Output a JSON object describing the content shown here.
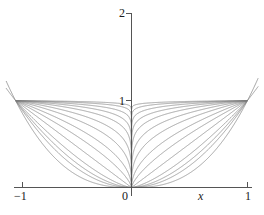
{
  "chart_data": {
    "type": "line",
    "title": "",
    "xlabel": "x",
    "ylabel": "",
    "xlim": [
      -1.12,
      1.12
    ],
    "ylim": [
      0,
      2.12
    ],
    "grid": false,
    "legend": null,
    "x_ticks": [
      {
        "value": -1,
        "label": "−1"
      },
      {
        "value": 0,
        "label": "0"
      },
      {
        "value": 1,
        "label": "1"
      }
    ],
    "y_ticks": [
      {
        "value": 1,
        "label": "1"
      },
      {
        "value": 2,
        "label": "2"
      }
    ],
    "series": [
      {
        "name": "p = 2.00",
        "exponent": 2.0,
        "x": [
          -1,
          -0.75,
          -0.5,
          -0.25,
          0,
          0.25,
          0.5,
          0.75,
          1
        ],
        "values": [
          1,
          0.563,
          0.25,
          0.063,
          0,
          0.063,
          0.25,
          0.563,
          1
        ]
      },
      {
        "name": "p = 1.40",
        "exponent": 1.4,
        "x": [
          -1,
          -0.75,
          -0.5,
          -0.25,
          0,
          0.25,
          0.5,
          0.75,
          1
        ],
        "values": [
          1,
          0.667,
          0.379,
          0.144,
          0,
          0.144,
          0.379,
          0.667,
          1
        ]
      },
      {
        "name": "p = 1.00",
        "exponent": 1.0,
        "x": [
          -1,
          -0.75,
          -0.5,
          -0.25,
          0,
          0.25,
          0.5,
          0.75,
          1
        ],
        "values": [
          1,
          0.75,
          0.5,
          0.25,
          0,
          0.25,
          0.5,
          0.75,
          1
        ]
      },
      {
        "name": "p = 0.70",
        "exponent": 0.7,
        "x": [
          -1,
          -0.75,
          -0.5,
          -0.25,
          0,
          0.25,
          0.5,
          0.75,
          1
        ],
        "values": [
          1,
          0.821,
          0.616,
          0.379,
          0,
          0.379,
          0.616,
          0.821,
          1
        ]
      },
      {
        "name": "p = 0.50",
        "exponent": 0.5,
        "x": [
          -1,
          -0.75,
          -0.5,
          -0.25,
          0,
          0.25,
          0.5,
          0.75,
          1
        ],
        "values": [
          1,
          0.866,
          0.707,
          0.5,
          0,
          0.5,
          0.707,
          0.866,
          1
        ]
      },
      {
        "name": "p = 0.33",
        "exponent": 0.333,
        "x": [
          -1,
          -0.75,
          -0.5,
          -0.25,
          0,
          0.25,
          0.5,
          0.75,
          1
        ],
        "values": [
          1,
          0.909,
          0.794,
          0.63,
          0,
          0.63,
          0.794,
          0.909,
          1
        ]
      },
      {
        "name": "p = 0.22",
        "exponent": 0.22,
        "x": [
          -1,
          -0.75,
          -0.5,
          -0.25,
          0,
          0.25,
          0.5,
          0.75,
          1
        ],
        "values": [
          1,
          0.938,
          0.858,
          0.736,
          0,
          0.736,
          0.858,
          0.938,
          1
        ]
      },
      {
        "name": "p = 0.14",
        "exponent": 0.14,
        "x": [
          -1,
          -0.75,
          -0.5,
          -0.25,
          0,
          0.25,
          0.5,
          0.75,
          1
        ],
        "values": [
          1,
          0.96,
          0.908,
          0.824,
          0,
          0.824,
          0.908,
          0.96,
          1
        ]
      },
      {
        "name": "p = 0.09",
        "exponent": 0.09,
        "x": [
          -1,
          -0.75,
          -0.5,
          -0.25,
          0,
          0.25,
          0.5,
          0.75,
          1
        ],
        "values": [
          1,
          0.974,
          0.939,
          0.882,
          0,
          0.882,
          0.939,
          0.974,
          1
        ]
      },
      {
        "name": "p = 0.055",
        "exponent": 0.055,
        "x": [
          -1,
          -0.75,
          -0.5,
          -0.25,
          0,
          0.25,
          0.5,
          0.75,
          1
        ],
        "values": [
          1,
          0.984,
          0.962,
          0.927,
          0,
          0.927,
          0.962,
          0.984,
          1
        ]
      },
      {
        "name": "p = 0.03",
        "exponent": 0.03,
        "x": [
          -1,
          -0.75,
          -0.5,
          -0.25,
          0,
          0.25,
          0.5,
          0.75,
          1
        ],
        "values": [
          1,
          0.991,
          0.979,
          0.959,
          0,
          0.959,
          0.979,
          0.991,
          1
        ]
      },
      {
        "name": "p = 0.015",
        "exponent": 0.015,
        "x": [
          -1,
          -0.75,
          -0.5,
          -0.25,
          0,
          0.25,
          0.5,
          0.75,
          1
        ],
        "values": [
          1,
          0.996,
          0.99,
          0.979,
          0,
          0.979,
          0.99,
          0.996,
          1
        ]
      },
      {
        "name": "p = 2.60",
        "exponent": 2.6,
        "x": [
          -1.12,
          -0.75,
          -0.5,
          -0.25,
          0,
          0.25,
          0.5,
          0.75,
          1.12
        ],
        "values": [
          1.36,
          0.459,
          0.165,
          0.027,
          0,
          0.027,
          0.165,
          0.459,
          1.36
        ]
      },
      {
        "name": "p = 1.70 extended",
        "exponent": 1.7,
        "x": [
          -1.12,
          -0.75,
          -0.5,
          -0.25,
          0,
          0.25,
          0.5,
          0.75,
          1.12
        ],
        "values": [
          1.21,
          0.613,
          0.308,
          0.095,
          0,
          0.095,
          0.308,
          0.613,
          1.21
        ]
      }
    ]
  },
  "axes": {
    "x_axis_label": "x",
    "x_tick_left": "−1",
    "x_tick_origin": "0",
    "x_tick_right": "1",
    "y_tick_one": "1",
    "y_tick_two": "2"
  },
  "style": {
    "curve_color": "#7d7d7d",
    "axis_color": "#555555",
    "text_color": "#1a1a1a",
    "background": "#ffffff"
  }
}
